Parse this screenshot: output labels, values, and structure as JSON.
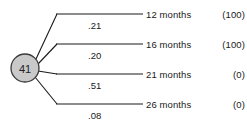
{
  "diagram": {
    "type": "probability-tree",
    "root_node": {
      "label": "41",
      "fill_color": "#c9c9c9",
      "stroke_color": "#3a3a3a"
    },
    "line_color": "#1a1a1a",
    "background_color": "#ffffff",
    "branches": [
      {
        "probability": ".21",
        "outcome_name": "12 months",
        "outcome_value": "(100)"
      },
      {
        "probability": ".20",
        "outcome_name": "16 months",
        "outcome_value": "(100)"
      },
      {
        "probability": ".51",
        "outcome_name": "21 months",
        "outcome_value": "(0)"
      },
      {
        "probability": ".08",
        "outcome_name": "26 months",
        "outcome_value": "(0)"
      }
    ]
  }
}
